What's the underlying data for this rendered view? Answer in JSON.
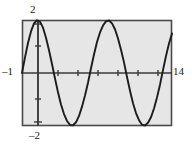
{
  "figure": {
    "name": "graphing-calculator-sine-window",
    "background_color": "#ffffff",
    "plot_background_color": "#e6e6e6",
    "frame_color": "#4a4a4a",
    "axis_color": "#3a3a3a",
    "curve_color": "#1c1c1c"
  },
  "labels": {
    "y_max": "2",
    "y_min": "–2",
    "x_min": "–1",
    "x_max": "14"
  },
  "chart_data": {
    "type": "line",
    "title": "",
    "subtitle": "",
    "xlabel": "",
    "ylabel": "",
    "xlim": [
      -1,
      14
    ],
    "ylim": [
      -2,
      2
    ],
    "grid": false,
    "legend": null,
    "legend_position": "none",
    "x_tick_labels": [
      "–1",
      "14"
    ],
    "y_tick_labels": [
      "2",
      "–2"
    ],
    "x_tick_spacing": 2,
    "y_tick_spacing": 1,
    "x_ticks": [
      0,
      2,
      4,
      6,
      8,
      10,
      12,
      14
    ],
    "y_ticks": [
      -2,
      -1,
      0,
      1,
      2
    ],
    "annotations": [],
    "series": [
      {
        "name": "y = 2 sin(x + 1)",
        "amplitude": 2,
        "period": 6.2832,
        "phase_shift": -1,
        "vertical_shift": 0,
        "x": [
          -1.0,
          -0.7,
          -0.4,
          -0.1,
          0.2,
          0.5,
          0.8,
          1.1,
          1.4,
          1.7,
          2.0,
          2.3,
          2.6,
          2.9,
          3.2,
          3.5,
          3.8,
          4.1,
          4.4,
          4.7,
          5.0,
          5.3,
          5.6,
          5.9,
          6.2,
          6.5,
          6.8,
          7.1,
          7.4,
          7.7,
          8.0,
          8.3,
          8.6,
          8.9,
          9.2,
          9.5,
          9.8,
          10.1,
          10.4,
          10.7,
          11.0,
          11.3,
          11.6,
          11.9,
          12.2,
          12.5,
          12.8,
          13.1,
          13.4,
          13.7,
          14.0
        ],
        "y": [
          0.0,
          0.59,
          1.13,
          1.57,
          1.87,
          1.99,
          1.94,
          1.71,
          1.33,
          0.86,
          0.34,
          -0.21,
          -0.73,
          -1.19,
          -1.55,
          -1.81,
          -1.96,
          -1.97,
          -1.86,
          -1.62,
          -1.27,
          -0.85,
          -0.37,
          0.18,
          0.7,
          1.17,
          1.53,
          1.79,
          1.95,
          1.98,
          1.87,
          1.65,
          1.3,
          0.88,
          0.4,
          -0.15,
          -0.67,
          -1.14,
          -1.51,
          -1.78,
          -1.95,
          -1.98,
          -1.88,
          -1.67,
          -1.34,
          -0.92,
          -0.44,
          0.11,
          0.64,
          1.11,
          1.49
        ]
      }
    ]
  }
}
